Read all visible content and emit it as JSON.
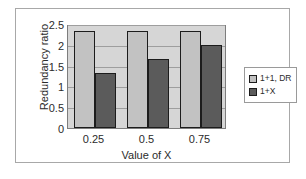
{
  "chart_data": {
    "type": "bar",
    "title": "",
    "xlabel": "Value of X",
    "ylabel": "Redundancy ratio",
    "categories": [
      "0.25",
      "0.5",
      "0.75"
    ],
    "series": [
      {
        "name": "1+1, DR",
        "values": [
          2.33,
          2.33,
          2.33
        ],
        "color": "#c2c2c2"
      },
      {
        "name": "1+X",
        "values": [
          1.33,
          1.67,
          2.0
        ],
        "color": "#5b5b5b"
      }
    ],
    "ylim": [
      0,
      2.5
    ],
    "ytick_labels": [
      "0",
      "0.5",
      "1",
      "1.5",
      "2",
      "2.5"
    ],
    "ytick_values": [
      0,
      0.5,
      1,
      1.5,
      2,
      2.5
    ],
    "grid": true,
    "legend_position": "right",
    "plot_background": "#d6d6d6",
    "figure_background": "#ffffff"
  }
}
